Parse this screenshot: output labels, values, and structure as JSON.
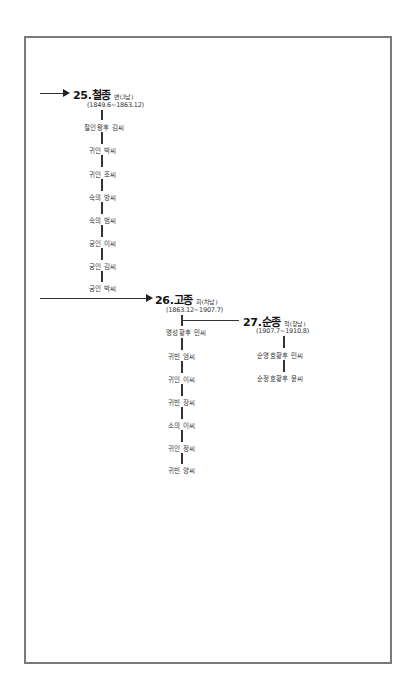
{
  "kings": [
    {
      "number_name": "25.철종",
      "tag": "변(3남)",
      "reign": "(1849.6~1863.12)",
      "consorts": [
        "철인왕후 김씨",
        "귀인 박씨",
        "귀인 조씨",
        "숙의 방씨",
        "숙의 범씨",
        "궁인 이씨",
        "궁인 김씨",
        "궁인 박씨"
      ]
    },
    {
      "number_name": "26.고종",
      "tag": "희(차남)",
      "reign": "(1863.12~1907.7)",
      "consorts": [
        "명성황후 민씨",
        "귀빈 엄씨",
        "귀인 이씨",
        "귀빈 장씨",
        "소의 이씨",
        "귀인 정씨",
        "귀빈 양씨"
      ]
    },
    {
      "number_name": "27.순종",
      "tag": "척(장남)",
      "reign": "(1907.7~1910.8)",
      "consorts": [
        "순명효황후 민씨",
        "순정효황후 윤씨"
      ]
    }
  ]
}
